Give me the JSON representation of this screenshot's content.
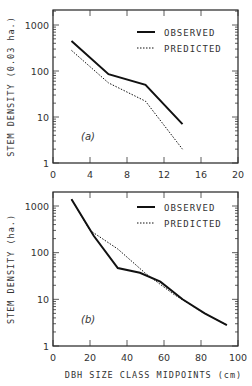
{
  "chart_data": [
    {
      "type": "line",
      "panel_label": "(a)",
      "ylabel": "STEM DENSITY (0.03 ha.)",
      "xlabel": "",
      "yscale": "log",
      "xlim": [
        0,
        20
      ],
      "ylim": [
        1,
        2000
      ],
      "xticks": [
        "0",
        "4",
        "8",
        "12",
        "16",
        "20"
      ],
      "yticks": [
        "1",
        "10",
        "100",
        "1000"
      ],
      "legend": [
        "OBSERVED",
        "PREDICTED"
      ],
      "legend_position": "upper right",
      "series": [
        {
          "name": "OBSERVED",
          "style": "solid",
          "x": [
            2,
            6,
            10,
            14
          ],
          "values": [
            450,
            85,
            50,
            7
          ]
        },
        {
          "name": "PREDICTED",
          "style": "dotted",
          "x": [
            2,
            6,
            10,
            14
          ],
          "values": [
            280,
            55,
            22,
            2
          ]
        }
      ]
    },
    {
      "type": "line",
      "panel_label": "(b)",
      "ylabel": "STEM DENSITY (ha.)",
      "xlabel": "DBH SIZE CLASS MIDPOINTS (cm)",
      "yscale": "log",
      "xlim": [
        0,
        100
      ],
      "ylim": [
        1,
        2000
      ],
      "xticks": [
        "0",
        "20",
        "40",
        "60",
        "80",
        "100"
      ],
      "yticks": [
        "1",
        "10",
        "100",
        "1000"
      ],
      "legend": [
        "OBSERVED",
        "PREDICTED"
      ],
      "legend_position": "upper right",
      "series": [
        {
          "name": "OBSERVED",
          "style": "solid",
          "x": [
            10,
            22,
            35,
            47,
            58,
            70,
            82,
            94
          ],
          "values": [
            1400,
            230,
            47,
            37,
            24,
            10,
            5,
            2.8
          ]
        },
        {
          "name": "PREDICTED",
          "style": "dotted",
          "x": [
            10,
            20,
            35,
            50,
            65,
            80,
            94
          ],
          "values": [
            1400,
            300,
            120,
            36,
            13,
            5.5,
            2.8
          ]
        }
      ]
    }
  ]
}
